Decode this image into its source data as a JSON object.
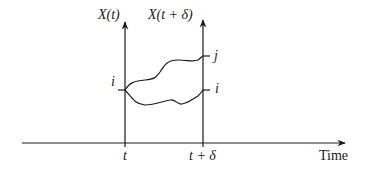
{
  "diagram": {
    "left_axis_label": "X(t)",
    "right_axis_label": "X(t + δ)",
    "time_axis_label": "Time",
    "tick_t": "t",
    "tick_t_delta": "t + δ",
    "start_state": "i",
    "end_state_upper": "j",
    "end_state_lower": "i"
  }
}
